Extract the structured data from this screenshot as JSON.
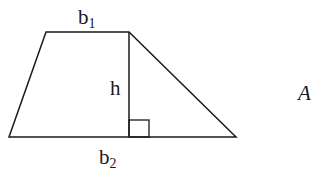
{
  "diagram": {
    "shape": "trapezoid",
    "labels": {
      "top_base": "b",
      "top_base_sub": "1",
      "bottom_base": "b",
      "bottom_base_sub": "2",
      "height": "h",
      "area": "A"
    },
    "colors": {
      "stroke": "#1a1a1a",
      "background": "#ffffff"
    }
  }
}
